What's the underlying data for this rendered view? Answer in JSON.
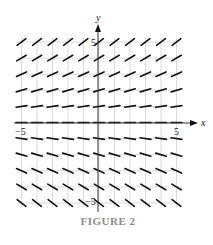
{
  "figure": {
    "caption": "FIGURE 2",
    "x_axis_label": "x",
    "y_axis_label": "y",
    "x_ticks": [
      {
        "value": -5,
        "label": "−5"
      },
      {
        "value": 5,
        "label": "5"
      }
    ],
    "y_ticks": [
      {
        "value": 5,
        "label": "5"
      },
      {
        "value": -5,
        "label": "−5"
      }
    ],
    "colors": {
      "segment": "#111111",
      "grid": "#cfcfcf",
      "axis": "#333333",
      "caption": "#8a8a8a"
    }
  },
  "chart_data": {
    "type": "slope_field",
    "title": "FIGURE 2",
    "xlabel": "x",
    "ylabel": "y",
    "xlim": [
      -5,
      5
    ],
    "ylim": [
      -5,
      5
    ],
    "grid": true,
    "grid_x": [
      -5,
      -4,
      -3,
      -2,
      -1,
      0,
      1,
      2,
      3,
      4,
      5
    ],
    "grid_y": [
      5,
      4,
      3,
      2,
      1,
      0,
      -1,
      -2,
      -3,
      -4,
      -5
    ],
    "slope_depends_on": "y only",
    "slope_by_row": [
      {
        "y": 5,
        "relative_slope": 0.75
      },
      {
        "y": 4,
        "relative_slope": 0.6
      },
      {
        "y": 3,
        "relative_slope": 0.45
      },
      {
        "y": 2,
        "relative_slope": 0.3
      },
      {
        "y": 1,
        "relative_slope": 0.15
      },
      {
        "y": 0,
        "relative_slope": 0
      },
      {
        "y": -1,
        "relative_slope": -0.15
      },
      {
        "y": -2,
        "relative_slope": -0.3
      },
      {
        "y": -3,
        "relative_slope": -0.45
      },
      {
        "y": -4,
        "relative_slope": -0.6
      },
      {
        "y": -5,
        "relative_slope": -0.75
      }
    ]
  }
}
